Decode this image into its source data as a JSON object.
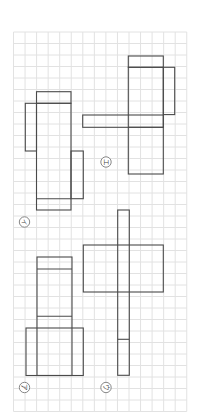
{
  "figure": {
    "grid": {
      "x0": 13.5,
      "y0": 32,
      "cell_w": 11.55,
      "cell_h": 11.5,
      "cols": 15,
      "rows": 33,
      "color": "#e2e2e2"
    },
    "stroke_color": "#4a4a4a",
    "nets": [
      {
        "id": "a",
        "label": "ア",
        "label_pos": [
          24.5,
          387.5
        ],
        "rects": [
          [
            37,
            257,
            35,
            118.5
          ],
          [
            26,
            328,
            57.3,
            47.5
          ]
        ],
        "lines": [
          [
            37,
            269,
            72,
            269
          ],
          [
            37,
            316.3,
            72,
            316.3
          ]
        ]
      },
      {
        "id": "i",
        "label": "イ",
        "label_pos": [
          24.5,
          222
        ],
        "rects": [
          [
            36.5,
            91.7,
            34.5,
            11.6
          ],
          [
            25.3,
            103.3,
            11.2,
            47.7
          ],
          [
            36.5,
            103.3,
            34.5,
            106.7
          ],
          [
            71,
            151,
            12.3,
            47.7
          ]
        ],
        "lines": [
          [
            36.5,
            198.7,
            71,
            198.7
          ]
        ]
      },
      {
        "id": "u",
        "label": "ウ",
        "label_pos": [
          106,
          387.5
        ],
        "rects": [
          [
            117.7,
            210,
            11.6,
            165.3
          ],
          [
            83.3,
            245,
            80,
            47
          ]
        ],
        "lines": [
          [
            117.7,
            339.3,
            129.3,
            339.3
          ]
        ]
      },
      {
        "id": "e",
        "label": "エ",
        "label_pos": [
          106,
          162
        ],
        "rects": [
          [
            128.3,
            56,
            35,
            11.3
          ],
          [
            128.3,
            67.3,
            35,
            106.7
          ],
          [
            163.3,
            67.3,
            11.4,
            47.3
          ],
          [
            82.7,
            115,
            80.6,
            12.3
          ]
        ],
        "lines": [
          [
            128.3,
            127.3,
            163.3,
            127.3
          ]
        ]
      }
    ]
  }
}
